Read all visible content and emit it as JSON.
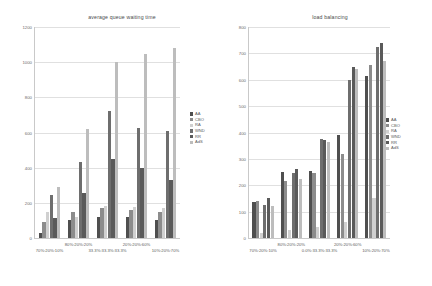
{
  "chart_data": [
    {
      "type": "bar",
      "title": "average queue waiting time",
      "xlabel": "",
      "ylabel": "",
      "ylim": [
        0,
        1200
      ],
      "yticks": [
        0,
        200,
        400,
        600,
        800,
        1000,
        1200
      ],
      "grid": true,
      "legend_position": "right",
      "categories": [
        "70%:20%:10%",
        "80%:20%:20%",
        "33.3%:33.3%:33.3%",
        "20%:20%:60%",
        "10%:20%:70%"
      ],
      "series": [
        {
          "name": "AA",
          "color": "#4f4f4f",
          "values": [
            28,
            100,
            118,
            118,
            105
          ]
        },
        {
          "name": "CBO",
          "color": "#8c8c8c",
          "values": [
            90,
            150,
            170,
            160,
            150
          ]
        },
        {
          "name": "RA",
          "color": "#d0d0d0",
          "values": [
            150,
            120,
            180,
            175,
            170
          ]
        },
        {
          "name": "WND",
          "color": "#6e6e6e",
          "values": [
            245,
            430,
            720,
            625,
            610
          ]
        },
        {
          "name": "RR",
          "color": "#5a5a5a",
          "values": [
            115,
            255,
            450,
            400,
            330
          ]
        },
        {
          "name": "AdS",
          "color": "#bdbdbd",
          "values": [
            290,
            620,
            1000,
            1045,
            1080
          ]
        }
      ]
    },
    {
      "type": "bar",
      "title": "load balancing",
      "xlabel": "",
      "ylabel": "",
      "ylim": [
        0,
        800
      ],
      "yticks": [
        0,
        100,
        200,
        300,
        400,
        500,
        600,
        700,
        800
      ],
      "grid": true,
      "legend_position": "right",
      "categories": [
        "70%:20%:10%",
        "80%:20%:20%",
        "0.0%:33.3%:33.3%",
        "20%:20%:60%",
        "10%:20%:70%"
      ],
      "series": [
        {
          "name": "AA",
          "color": "#4f4f4f",
          "values": [
            135,
            250,
            255,
            390,
            615
          ]
        },
        {
          "name": "CBO",
          "color": "#8c8c8c",
          "values": [
            140,
            215,
            245,
            320,
            655
          ]
        },
        {
          "name": "RA",
          "color": "#d0d0d0",
          "values": [
            20,
            30,
            40,
            60,
            150
          ]
        },
        {
          "name": "WND",
          "color": "#6e6e6e",
          "values": [
            125,
            245,
            375,
            600,
            725
          ]
        },
        {
          "name": "RR",
          "color": "#5a5a5a",
          "values": [
            150,
            260,
            370,
            650,
            740
          ]
        },
        {
          "name": "AdS",
          "color": "#bdbdbd",
          "values": [
            120,
            225,
            365,
            640,
            670
          ]
        }
      ]
    }
  ],
  "legend": {
    "items": [
      "AA",
      "CBO",
      "RA",
      "WND",
      "RR",
      "AdS"
    ]
  }
}
